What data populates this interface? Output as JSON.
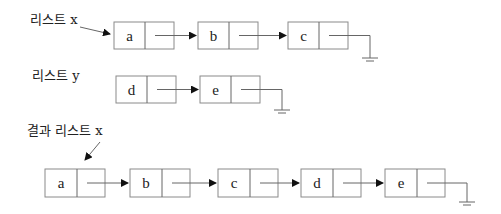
{
  "labels": {
    "list_x": "리스트 x",
    "list_y": "리스트 y",
    "result_list_x": "결과 리스트 x"
  },
  "lists": {
    "list_x": {
      "nodes": [
        "a",
        "b",
        "c"
      ],
      "terminator": "null-ground"
    },
    "list_y": {
      "nodes": [
        "d",
        "e"
      ],
      "terminator": "null-ground"
    },
    "result_list_x": {
      "nodes": [
        "a",
        "b",
        "c",
        "d",
        "e"
      ],
      "terminator": "null-ground"
    }
  },
  "colors": {
    "line": "#666666",
    "box_border": "#8a8a8a",
    "text": "#222222"
  }
}
